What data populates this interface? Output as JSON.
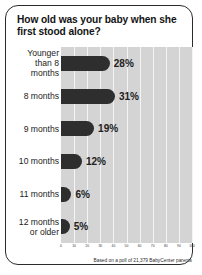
{
  "card": {
    "title": "How old was your baby when she first stood alone?",
    "footnote": "Based on a poll of 21,379 BabyCenter parents"
  },
  "colors": {
    "bar": "#2e2e2e",
    "plot_background": "#d4d4d4",
    "gridline": "#f4f4f4",
    "border": "#2b2b2b",
    "text": "#141414"
  },
  "chart_data": {
    "type": "bar",
    "orientation": "horizontal",
    "title": "How old was your baby when she first stood alone?",
    "xlabel": "",
    "ylabel": "",
    "xlim": [
      0,
      100
    ],
    "grid": true,
    "legend": null,
    "annotation": "Based on a poll of 21,379 BabyCenter parents",
    "categories": [
      "Younger than 8 months",
      "8 months",
      "9 months",
      "10 months",
      "11 months",
      "12 months or older"
    ],
    "category_lines": [
      [
        "Younger",
        "than 8",
        "months"
      ],
      [
        "8 months"
      ],
      [
        "9 months"
      ],
      [
        "10 months"
      ],
      [
        "11 months"
      ],
      [
        "12 months",
        "or older"
      ]
    ],
    "values": [
      28,
      31,
      19,
      12,
      6,
      5
    ],
    "value_labels": [
      "28%",
      "31%",
      "19%",
      "12%",
      "6%",
      "5%"
    ],
    "xticks": [
      0,
      10,
      20,
      30,
      40,
      50,
      60,
      70,
      80,
      90,
      100
    ],
    "xtick_labels": [
      "0",
      "10",
      "20",
      "30",
      "40",
      "50",
      "60",
      "70",
      "80",
      "90",
      "100"
    ]
  }
}
